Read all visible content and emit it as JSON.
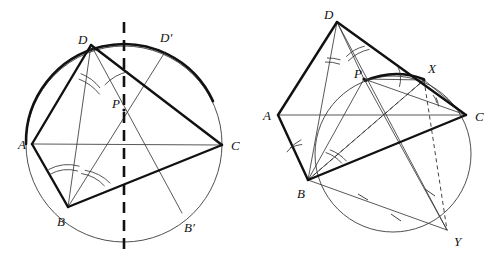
{
  "figure": {
    "background_color": "#ffffff",
    "ink_color": "#111111",
    "light_ink_color": "#3a3a3a",
    "width": 493,
    "height": 265
  },
  "panels": [
    {
      "id": "left-panel",
      "name": "reflection-in-perpendicular-bisector",
      "circle": {
        "cx": 124,
        "cy": 144,
        "r": 98
      },
      "points": [
        {
          "id": "A",
          "label": "A",
          "x": 32,
          "y": 144,
          "label_x": 18,
          "label_y": 149
        },
        {
          "id": "B",
          "label": "B",
          "x": 68,
          "y": 207,
          "label_x": 57,
          "label_y": 226
        },
        {
          "id": "C",
          "label": "C",
          "x": 222,
          "y": 145,
          "label_x": 231,
          "label_y": 150
        },
        {
          "id": "D",
          "label": "D",
          "x": 91,
          "y": 45,
          "label_x": 78,
          "label_y": 44
        },
        {
          "id": "P",
          "label": "P",
          "x": 124,
          "y": 110,
          "label_x": 112,
          "label_y": 108
        },
        {
          "id": "Dp",
          "label": "D′",
          "x": 165,
          "y": 52,
          "label_x": 164,
          "label_y": 42
        },
        {
          "id": "Bp",
          "label": "B′",
          "x": 182,
          "y": 213,
          "label_x": 186,
          "label_y": 232
        }
      ],
      "heavy_segments": [
        {
          "from": "A",
          "to": "D"
        },
        {
          "from": "A",
          "to": "B"
        },
        {
          "from": "D",
          "to": "C"
        },
        {
          "from": "B",
          "to": "C"
        }
      ],
      "light_segments": [
        {
          "from": "A",
          "to": "C"
        },
        {
          "from": "B",
          "to": "D"
        },
        {
          "from": "D",
          "to": "Bp"
        },
        {
          "from": "B",
          "to": "Dp"
        },
        {
          "from": "D",
          "to": "P"
        },
        {
          "from": "B",
          "to": "P"
        }
      ],
      "dashed_axis": {
        "x": 124,
        "y1": 22,
        "y2": 252
      },
      "heavy_arcs": [
        {
          "name": "arc-A-to-D-to-Dprime",
          "start_deg": 180,
          "end_deg": 310
        },
        {
          "name": "arc-Dprime-to-C",
          "start_deg": 310,
          "end_deg": 359
        }
      ],
      "angle_marks": [
        {
          "at": "D",
          "name": "angle-ADB"
        },
        {
          "at": "D",
          "name": "angle-BDP"
        },
        {
          "at": "B",
          "name": "angle-ABD"
        },
        {
          "at": "B",
          "name": "angle-DBP"
        }
      ]
    },
    {
      "id": "right-panel",
      "name": "spiral-similarity-circle-BPXCY",
      "circle": {
        "cx": 393,
        "cy": 154,
        "r": 78
      },
      "points": [
        {
          "id": "A",
          "label": "A",
          "x": 278,
          "y": 115,
          "label_x": 263,
          "label_y": 120
        },
        {
          "id": "B",
          "label": "B",
          "x": 308,
          "y": 180,
          "label_x": 297,
          "label_y": 198
        },
        {
          "id": "C",
          "label": "C",
          "x": 466,
          "y": 115,
          "label_x": 475,
          "label_y": 121
        },
        {
          "id": "D",
          "label": "D",
          "x": 337,
          "y": 22,
          "label_x": 324,
          "label_y": 19
        },
        {
          "id": "P",
          "label": "P",
          "x": 364,
          "y": 79,
          "label_x": 354,
          "label_y": 78
        },
        {
          "id": "X",
          "label": "X",
          "x": 424,
          "y": 80,
          "label_x": 428,
          "label_y": 73
        },
        {
          "id": "Y",
          "label": "Y",
          "x": 447,
          "y": 230,
          "label_x": 454,
          "label_y": 246
        }
      ],
      "heavy_segments": [
        {
          "from": "A",
          "to": "D"
        },
        {
          "from": "A",
          "to": "B"
        },
        {
          "from": "D",
          "to": "C"
        },
        {
          "from": "B",
          "to": "C"
        }
      ],
      "light_segments": [
        {
          "from": "A",
          "to": "C"
        },
        {
          "from": "B",
          "to": "D"
        },
        {
          "from": "B",
          "to": "P"
        },
        {
          "from": "D",
          "to": "P"
        },
        {
          "from": "P",
          "to": "C"
        },
        {
          "from": "P",
          "to": "X"
        },
        {
          "from": "B",
          "to": "X"
        },
        {
          "from": "B",
          "to": "Y"
        },
        {
          "from": "D",
          "to": "Y"
        },
        {
          "from": "P",
          "to": "Y"
        },
        {
          "from": "X",
          "to": "C"
        }
      ],
      "dashed_segments": [
        {
          "from": "B",
          "to": "X"
        },
        {
          "from": "X",
          "to": "Y"
        },
        {
          "from": "B",
          "to": "C"
        }
      ],
      "heavy_arcs": [
        {
          "name": "arc-P-to-X",
          "start_deg": 250,
          "end_deg": 289
        }
      ],
      "angle_marks": [
        {
          "at": "D",
          "name": "angle-ADB"
        },
        {
          "at": "D",
          "name": "angle-PDC"
        },
        {
          "at": "B",
          "name": "angle-ABD"
        },
        {
          "at": "B",
          "name": "angle-PBC"
        },
        {
          "at": "X",
          "name": "angle-PXB"
        },
        {
          "at": "X",
          "name": "angle-BXC"
        }
      ],
      "tick_marks": [
        {
          "name": "tick-on-XY",
          "x": 430,
          "y": 193
        },
        {
          "name": "tick-on-BY",
          "x": 396,
          "y": 219
        },
        {
          "name": "tick-on-DY-upper",
          "x": 426,
          "y": 196
        }
      ]
    }
  ]
}
